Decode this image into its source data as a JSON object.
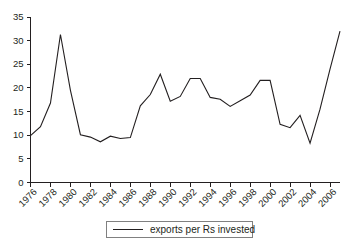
{
  "chart_data": {
    "type": "line",
    "title": "",
    "xlabel": "",
    "ylabel": "",
    "xlim": [
      1976,
      2007
    ],
    "ylim": [
      0,
      35
    ],
    "grid": false,
    "legend_position": "bottom-center",
    "y_ticks": [
      0,
      5,
      10,
      15,
      20,
      25,
      30,
      35
    ],
    "x_tick_labels": [
      "1976",
      "1978",
      "1980",
      "1982",
      "1984",
      "1986",
      "1988",
      "1990",
      "1992",
      "1994",
      "1996",
      "1998",
      "2000",
      "2002",
      "2004",
      "2006"
    ],
    "x": [
      1976,
      1977,
      1978,
      1979,
      1980,
      1981,
      1982,
      1983,
      1984,
      1985,
      1986,
      1987,
      1988,
      1989,
      1990,
      1991,
      1992,
      1993,
      1994,
      1995,
      1996,
      1997,
      1998,
      1999,
      2000,
      2001,
      2002,
      2003,
      2004,
      2005,
      2006,
      2007
    ],
    "series": [
      {
        "name": "exports per Rs invested",
        "color": "#231f20",
        "values": [
          9.9,
          11.8,
          16.8,
          31.3,
          19.5,
          10.1,
          9.6,
          8.6,
          9.8,
          9.3,
          9.5,
          16.2,
          18.6,
          22.9,
          17.2,
          18.2,
          22.0,
          22.0,
          18.0,
          17.6,
          16.1,
          17.3,
          18.5,
          21.6,
          21.6,
          12.3,
          11.6,
          14.2,
          8.3,
          15.5,
          24.0,
          32.0
        ]
      }
    ]
  },
  "legend": {
    "items": [
      {
        "label": "exports per Rs invested"
      }
    ]
  }
}
